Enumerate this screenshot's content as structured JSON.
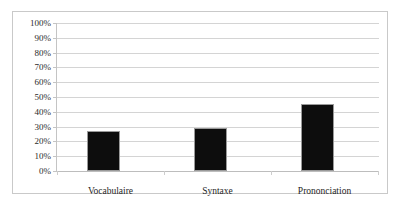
{
  "chart_data": {
    "type": "bar",
    "title": "",
    "subtitle": "",
    "xlabel": "",
    "ylabel": "",
    "categories": [
      "Vocabulaire",
      "Syntaxe",
      "Prononciation"
    ],
    "values": [
      27,
      29,
      45
    ],
    "value_labels": [
      "27%",
      "29%",
      "45%"
    ],
    "ylim": [
      0,
      100
    ],
    "ytick_labels": [
      "100%",
      "90%",
      "80%",
      "70%",
      "60%",
      "50%",
      "40%",
      "30%",
      "20%",
      "10%",
      "0%"
    ],
    "ytick_values": [
      100,
      90,
      80,
      70,
      60,
      50,
      40,
      30,
      20,
      10,
      0
    ],
    "grid": true,
    "legend": false,
    "legend_position": "none",
    "series": [
      {
        "name": "",
        "values": [
          27,
          29,
          45
        ],
        "color": "#0d0d0d"
      }
    ]
  },
  "style": {
    "bar_color": "#0d0d0d",
    "bar_edge_color": "#9a9a9a",
    "gridline_color": "#d4d4d4",
    "axis_color": "#c4c4c4",
    "frame_color": "#c9c9c9",
    "plot_background": "#ffffff",
    "label_color": "#2b2b2b"
  }
}
